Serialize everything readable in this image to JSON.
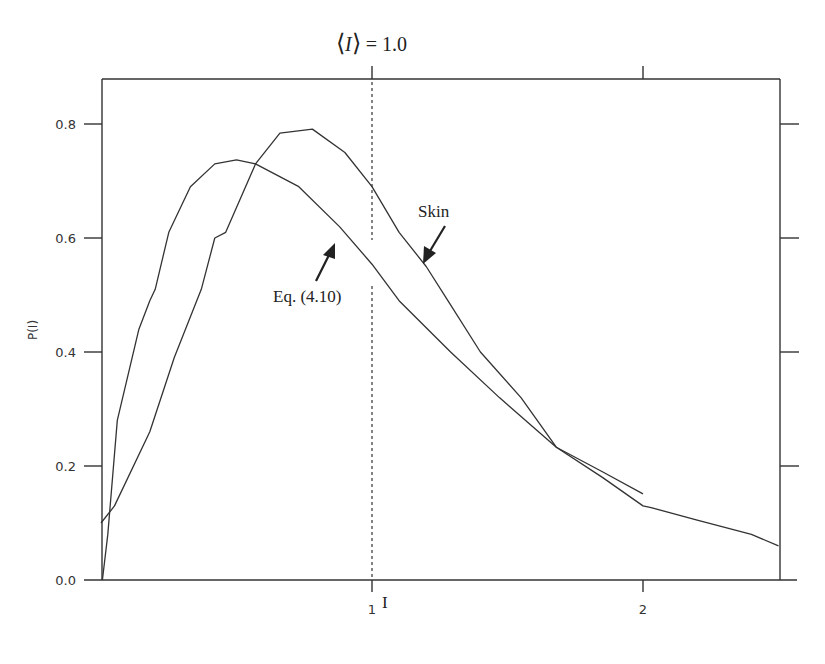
{
  "chart_data": {
    "type": "line",
    "title": "",
    "xlabel": "I",
    "ylabel": "P(I)",
    "xlim": [
      0,
      2.5
    ],
    "ylim": [
      0,
      0.88
    ],
    "grid": false,
    "x_ticks": [
      {
        "value": 1,
        "label": "1"
      },
      {
        "value": 2,
        "label": "2"
      }
    ],
    "y_ticks": [
      {
        "value": 0.0,
        "label": "0.0"
      },
      {
        "value": 0.2,
        "label": "0.2"
      },
      {
        "value": 0.4,
        "label": "0.4"
      },
      {
        "value": 0.6,
        "label": "0.6"
      },
      {
        "value": 0.8,
        "label": "0.8"
      }
    ],
    "top_ticks": [
      1,
      2
    ],
    "right_ticks": [
      0.2,
      0.4,
      0.6,
      0.8
    ],
    "series": [
      {
        "name": "Skin",
        "points": [
          [
            0.0,
            0.1
          ],
          [
            0.05,
            0.13
          ],
          [
            0.18,
            0.26
          ],
          [
            0.27,
            0.39
          ],
          [
            0.37,
            0.51
          ],
          [
            0.42,
            0.6
          ],
          [
            0.46,
            0.61
          ],
          [
            0.57,
            0.73
          ],
          [
            0.66,
            0.784
          ],
          [
            0.78,
            0.791
          ],
          [
            0.9,
            0.75
          ],
          [
            1.0,
            0.69
          ],
          [
            1.1,
            0.61
          ],
          [
            1.2,
            0.55
          ],
          [
            1.28,
            0.49
          ],
          [
            1.4,
            0.4
          ],
          [
            1.55,
            0.32
          ],
          [
            1.68,
            0.233
          ],
          [
            1.85,
            0.18
          ],
          [
            2.0,
            0.13
          ],
          [
            2.03,
            0.127
          ],
          [
            2.2,
            0.105
          ],
          [
            2.4,
            0.08
          ],
          [
            2.5,
            0.06
          ]
        ]
      },
      {
        "name": "Eq. (4.10)",
        "points": [
          [
            0.005,
            0.0
          ],
          [
            0.025,
            0.08
          ],
          [
            0.06,
            0.28
          ],
          [
            0.09,
            0.34
          ],
          [
            0.14,
            0.44
          ],
          [
            0.18,
            0.49
          ],
          [
            0.2,
            0.51
          ],
          [
            0.25,
            0.61
          ],
          [
            0.33,
            0.69
          ],
          [
            0.42,
            0.73
          ],
          [
            0.5,
            0.737
          ],
          [
            0.57,
            0.73
          ],
          [
            0.73,
            0.69
          ],
          [
            0.88,
            0.62
          ],
          [
            1.0,
            0.554
          ],
          [
            1.1,
            0.49
          ],
          [
            1.29,
            0.4
          ],
          [
            1.47,
            0.32
          ],
          [
            1.68,
            0.233
          ],
          [
            1.85,
            0.19
          ],
          [
            2.0,
            0.151
          ]
        ]
      }
    ],
    "annotations": [
      {
        "text": "⟨I⟩ = 1.0",
        "type": "vertical-dashed-line",
        "x": 1.0
      },
      {
        "text": "Skin",
        "type": "arrow-label",
        "points_to": "Skin"
      },
      {
        "text": "Eq. (4.10)",
        "type": "arrow-label",
        "points_to": "Eq. (4.10)"
      }
    ]
  },
  "labels": {
    "mean": "⟨I⟩ = 1.0",
    "mean_I": "I",
    "mean_rest": " = 1.0",
    "skin": "Skin",
    "eq": "Eq. (4.10)",
    "ylabel": "P(I)",
    "xlabel": "I"
  }
}
